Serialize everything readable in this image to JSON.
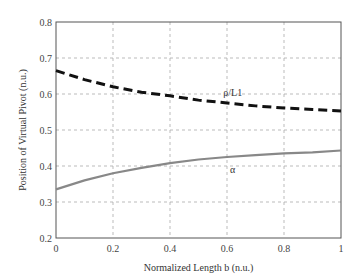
{
  "chart_data": {
    "type": "line",
    "title": "",
    "xlabel": "Normalized Length b (n.u.)",
    "ylabel": "Position of Virtual Pivot (n.u.)",
    "xlim": [
      0,
      1
    ],
    "ylim": [
      0.2,
      0.8
    ],
    "xticks": [
      "0",
      "0.2",
      "0.4",
      "0.6",
      "0.8",
      "1"
    ],
    "yticks": [
      "0.2",
      "0.3",
      "0.4",
      "0.5",
      "0.6",
      "0.7",
      "0.8"
    ],
    "grid": true,
    "x": [
      0,
      0.1,
      0.2,
      0.3,
      0.4,
      0.5,
      0.6,
      0.7,
      0.8,
      0.9,
      1.0
    ],
    "series": [
      {
        "name": "ρ/L1",
        "style": "dashed",
        "color": "#111111",
        "values": [
          0.665,
          0.64,
          0.62,
          0.605,
          0.595,
          0.583,
          0.575,
          0.567,
          0.561,
          0.557,
          0.553
        ]
      },
      {
        "name": "α",
        "style": "solid",
        "color": "#888888",
        "values": [
          0.335,
          0.36,
          0.38,
          0.395,
          0.408,
          0.418,
          0.425,
          0.43,
          0.435,
          0.438,
          0.443
        ]
      }
    ],
    "annotations": [
      {
        "text": "ρ/L1",
        "x": 0.62,
        "y": 0.595
      },
      {
        "text": "α",
        "x": 0.62,
        "y": 0.38
      }
    ]
  }
}
